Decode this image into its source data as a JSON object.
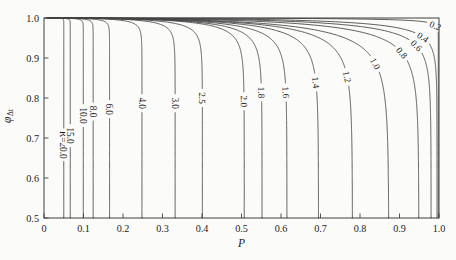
{
  "figure": {
    "background": "#fbfbf9",
    "line_color": "#474747",
    "text_color": "#1c1c1c",
    "frame_color": "#3f3f3f"
  },
  "chart_data": {
    "type": "line",
    "title": "",
    "xlabel": "P",
    "ylabel_main": "φ",
    "ylabel_sub": "Δt",
    "xlim": [
      0,
      1
    ],
    "ylim": [
      0.5,
      1.0
    ],
    "grid": false,
    "x_ticks": {
      "values": [
        0,
        0.1,
        0.2,
        0.3,
        0.4,
        0.5,
        0.6,
        0.7,
        0.8,
        0.9,
        1.0
      ],
      "labels": [
        "0",
        "0.1",
        "0.2",
        "0.3",
        "0.4",
        "0.5",
        "0.6",
        "0.7",
        "0.8",
        "0.9",
        "1.0"
      ]
    },
    "y_ticks": {
      "values": [
        1.0,
        0.9,
        0.8,
        0.7,
        0.6,
        0.5
      ],
      "labels": [
        "1.0",
        "0.9",
        "0.8",
        "0.7",
        "0.6",
        "0.5"
      ]
    },
    "curve_model": {
      "form": "P(F) = p_end * (1 - exp(-((1-F)/tau)^0.556))",
      "exponent": 0.556,
      "note": "p_end is the P value where the curve reaches the bottom of the chart (F = 0.5); tau controls knee sharpness; label_F is the F value at which the curve label sits, rotated along the local tangent."
    },
    "series": [
      {
        "label": "R=20.0",
        "R": 20.0,
        "p_end": 0.05,
        "tau": 0.00033,
        "label_F": 0.683
      },
      {
        "label": "15.0",
        "R": 15.0,
        "p_end": 0.0665,
        "tau": 0.00048,
        "label_F": 0.706
      },
      {
        "label": "10.0",
        "R": 10.0,
        "p_end": 0.0995,
        "tau": 0.00081,
        "label_F": 0.756
      },
      {
        "label": "8.0",
        "R": 8.0,
        "p_end": 0.1245,
        "tau": 0.00108,
        "label_F": 0.766
      },
      {
        "label": "6.0",
        "R": 6.0,
        "p_end": 0.166,
        "tau": 0.00158,
        "label_F": 0.772
      },
      {
        "label": "4.0",
        "R": 4.0,
        "p_end": 0.248,
        "tau": 0.00266,
        "label_F": 0.787
      },
      {
        "label": "3.0",
        "R": 3.0,
        "p_end": 0.332,
        "tau": 0.00388,
        "label_F": 0.787
      },
      {
        "label": "2.5",
        "R": 2.5,
        "p_end": 0.401,
        "tau": 0.00496,
        "label_F": 0.8
      },
      {
        "label": "2.0",
        "R": 2.0,
        "p_end": 0.507,
        "tau": 0.00673,
        "label_F": 0.792
      },
      {
        "label": "1.8",
        "R": 1.8,
        "p_end": 0.552,
        "tau": 0.00751,
        "label_F": 0.814
      },
      {
        "label": "1.6",
        "R": 1.6,
        "p_end": 0.615,
        "tau": 0.00865,
        "label_F": 0.814
      },
      {
        "label": "1.4",
        "R": 1.4,
        "p_end": 0.695,
        "tau": 0.01014,
        "label_F": 0.839
      },
      {
        "label": "1.2",
        "R": 1.2,
        "p_end": 0.781,
        "tau": 0.0118,
        "label_F": 0.853
      },
      {
        "label": "1.0",
        "R": 1.0,
        "p_end": 0.873,
        "tau": 0.01364,
        "label_F": 0.886
      },
      {
        "label": "0.8",
        "R": 0.8,
        "p_end": 0.949,
        "tau": 0.0114,
        "label_F": 0.913
      },
      {
        "label": "0.6",
        "R": 0.6,
        "p_end": 0.98,
        "tau": 0.0082,
        "label_F": 0.931
      },
      {
        "label": "0.4",
        "R": 0.4,
        "p_end": 0.995,
        "tau": 0.0055,
        "label_F": 0.952
      },
      {
        "label": "0.2",
        "R": 0.2,
        "p_end": 0.9987,
        "tau": 0.0011,
        "label_F": 0.981
      }
    ],
    "legend": "none (curves labelled in-line)"
  }
}
